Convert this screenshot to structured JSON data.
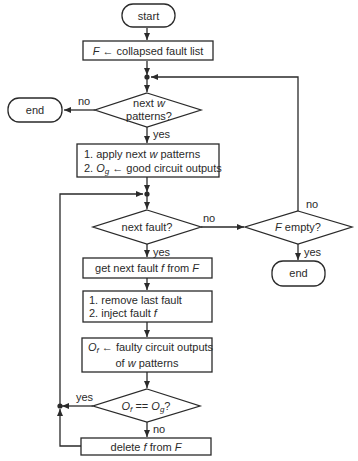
{
  "nodes": {
    "start": {
      "label": "start"
    },
    "init": {
      "prefix": "F",
      "arrow": " ← ",
      "text": "collapsed fault list"
    },
    "next_w": {
      "line1_a": "next ",
      "line1_w": "w",
      "line2": "patterns?"
    },
    "end_left": {
      "label": "end"
    },
    "apply": {
      "line1_a": "1. apply next ",
      "line1_w": "w",
      "line1_b": " patterns",
      "line2_a": "2. ",
      "line2_O": "O",
      "line2_sub": "g",
      "line2_b": " ← good circuit outputs"
    },
    "next_fault": {
      "label": "next fault?"
    },
    "f_empty": {
      "prefix": "F",
      "text": " empty?"
    },
    "end_right": {
      "label": "end"
    },
    "get_fault": {
      "a": "get next fault ",
      "f": "f",
      "b": " from ",
      "F": "F"
    },
    "inject": {
      "line1": "1. remove last fault",
      "line2_a": "2. inject fault ",
      "line2_f": "f"
    },
    "faulty": {
      "O": "O",
      "sub": "f",
      "line1_b": " ← faulty circuit outputs",
      "line2_a": "of ",
      "line2_w": "w",
      "line2_b": " patterns"
    },
    "compare": {
      "O1": "O",
      "sub1": "f",
      "eq": " == ",
      "O2": "O",
      "sub2": "g",
      "q": "?"
    },
    "delete": {
      "a": "delete ",
      "f": "f",
      "b": " from ",
      "F": "F"
    }
  },
  "edge_labels": {
    "next_w_no": "no",
    "next_w_yes": "yes",
    "next_fault_no": "no",
    "next_fault_yes": "yes",
    "f_empty_no": "no",
    "f_empty_yes": "yes",
    "compare_yes": "yes",
    "compare_no": "no"
  },
  "colors": {
    "stroke": "#2a2a2a",
    "background": "#ffffff"
  }
}
